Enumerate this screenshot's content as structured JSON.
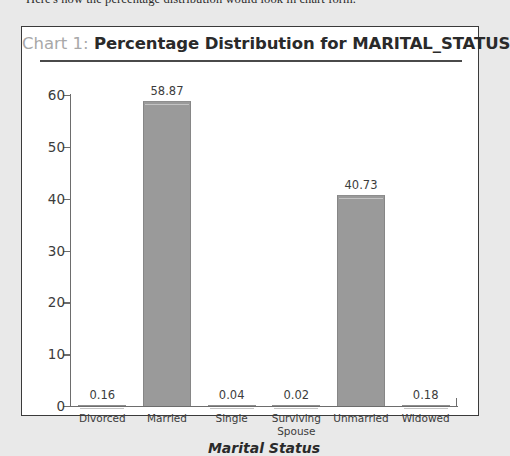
{
  "intro": {
    "text": "Here's how the percentage distribution would look in chart form."
  },
  "chart_panel": {
    "title_prefix": "Chart 1:",
    "title_main": "Percentage Distribution for MARITAL_STATUS"
  },
  "colors": {
    "page_background": "#e9e9e9",
    "panel_background": "#ffffff",
    "panel_border": "#3a3a3a",
    "bar_fill": "#9a9a9a",
    "axis_line": "#6d6d6d",
    "title_prefix": "#a8a8a8",
    "title_main": "#2a2a2a",
    "text": "#3c3c3c"
  },
  "chart_data": {
    "type": "bar",
    "title": "Chart 1: Percentage Distribution for MARITAL_STATUS",
    "xlabel": "Marital Status",
    "ylabel": "",
    "categories": [
      "Divorced",
      "Married",
      "Single",
      "Surviving\nSpouse",
      "Unmarried",
      "Widowed"
    ],
    "values": [
      0.16,
      58.87,
      0.04,
      0.02,
      40.73,
      0.18
    ],
    "value_labels": [
      "0.16",
      "58.87",
      "0.04",
      "0.02",
      "40.73",
      "0.18"
    ],
    "ylim": [
      0,
      60
    ],
    "yticks": [
      0,
      10,
      20,
      30,
      40,
      50,
      60
    ],
    "ytick_labels": [
      "0",
      "10",
      "20",
      "30",
      "40",
      "50",
      "60"
    ],
    "grid": false,
    "legend": false
  }
}
